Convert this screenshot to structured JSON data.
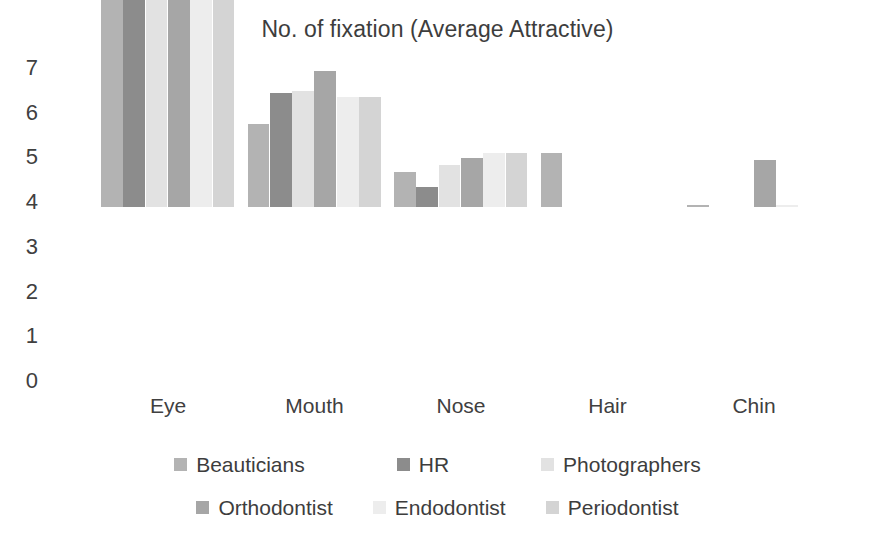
{
  "chart_data": {
    "type": "bar",
    "title": "No. of fixation (Average Attractive)",
    "xlabel": "",
    "ylabel": "",
    "ylim": [
      0,
      7
    ],
    "ytick_labels": [
      "7",
      "6",
      "5",
      "4",
      "3",
      "2",
      "1",
      "0"
    ],
    "ytick_values": [
      7,
      6,
      5,
      4,
      3,
      2,
      1,
      0
    ],
    "grid": false,
    "legend_position": "bottom",
    "categories": [
      "Eye",
      "Mouth",
      "Nose",
      "Hair",
      "Chin"
    ],
    "series": [
      {
        "name": "Beauticians",
        "color": "#b3b3b3",
        "values": [
          5.7,
          1.85,
          0.78,
          1.2,
          0.04
        ]
      },
      {
        "name": "HR",
        "color": "#8c8c8c",
        "values": [
          6.1,
          2.55,
          0.45,
          0,
          0
        ]
      },
      {
        "name": "Photographers",
        "color": "#e2e2e2",
        "values": [
          5.7,
          2.6,
          0.95,
          0,
          0
        ]
      },
      {
        "name": "Orthodontist",
        "color": "#a6a6a6",
        "values": [
          5.2,
          3.05,
          1.1,
          0,
          1.05
        ]
      },
      {
        "name": "Endodontist",
        "color": "#ededed",
        "values": [
          4.9,
          2.45,
          1.2,
          0,
          0.04
        ]
      },
      {
        "name": "Periodontist",
        "color": "#d4d4d4",
        "values": [
          5.2,
          2.45,
          1.2,
          0,
          0
        ]
      }
    ]
  },
  "legend": {
    "rows": [
      [
        "Beauticians",
        "HR",
        "Photographers"
      ],
      [
        "Orthodontist",
        "Endodontist",
        "Periodontist"
      ]
    ]
  }
}
